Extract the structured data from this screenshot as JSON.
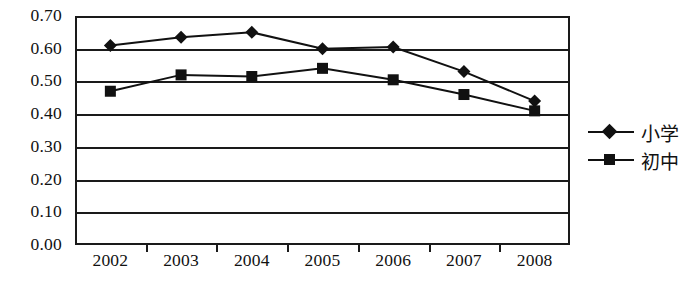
{
  "chart_data": {
    "type": "line",
    "title": "",
    "xlabel": "",
    "ylabel": "",
    "categories": [
      "2002",
      "2003",
      "2004",
      "2005",
      "2006",
      "2007",
      "2008"
    ],
    "series": [
      {
        "name": "小学",
        "marker": "diamond",
        "values": [
          0.61,
          0.635,
          0.65,
          0.6,
          0.605,
          0.53,
          0.44
        ]
      },
      {
        "name": "初中",
        "marker": "square",
        "values": [
          0.47,
          0.52,
          0.515,
          0.54,
          0.505,
          0.46,
          0.41
        ]
      }
    ],
    "ylim": [
      0.0,
      0.7
    ],
    "ytick_labels": [
      "0.70",
      "0.60",
      "0.50",
      "0.40",
      "0.30",
      "0.20",
      "0.10",
      "0.00"
    ],
    "ytick_values": [
      0.7,
      0.6,
      0.5,
      0.4,
      0.3,
      0.2,
      0.1,
      0.0
    ],
    "grid": true,
    "grid_axis": "y",
    "legend_position": "right",
    "series_color": "#111111",
    "axis_color": "#1a1a1a"
  },
  "legend": {
    "items": [
      {
        "label": "小学"
      },
      {
        "label": "初中"
      }
    ]
  }
}
